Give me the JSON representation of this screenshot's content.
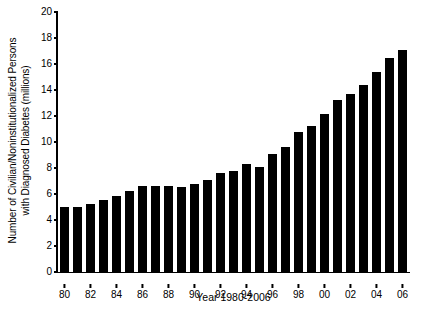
{
  "chart_data": {
    "type": "bar",
    "title": "",
    "xlabel": "Year 1980-2006",
    "ylabel_line1": "Number of Civilian/Noninstitutionalized Persons",
    "ylabel_line2": "with Diagnosed Diabetes (millions)",
    "ylim": [
      0,
      20
    ],
    "yticks": [
      0,
      2,
      4,
      6,
      8,
      10,
      12,
      14,
      16,
      18,
      20
    ],
    "ytick_labels": [
      "0",
      "2",
      "4",
      "6",
      "8",
      "10",
      "12",
      "14",
      "16",
      "18",
      "20"
    ],
    "grid": false,
    "legend": null,
    "bar_color": "#000000",
    "background": "#ffffff",
    "categories": [
      "1980",
      "1981",
      "1982",
      "1983",
      "1984",
      "1985",
      "1986",
      "1987",
      "1988",
      "1989",
      "1990",
      "1991",
      "1992",
      "1993",
      "1994",
      "1995",
      "1996",
      "1997",
      "1998",
      "1999",
      "2000",
      "2001",
      "2002",
      "2003",
      "2004",
      "2005",
      "2006"
    ],
    "xtick_labels": [
      "80",
      "",
      "82",
      "",
      "84",
      "",
      "86",
      "",
      "88",
      "",
      "90",
      "",
      "92",
      "",
      "94",
      "",
      "96",
      "",
      "98",
      "",
      "00",
      "",
      "02",
      "",
      "04",
      "",
      "06"
    ],
    "values": [
      5.0,
      5.0,
      5.25,
      5.55,
      5.85,
      6.2,
      6.6,
      6.6,
      6.6,
      6.55,
      6.8,
      7.1,
      7.6,
      7.75,
      8.3,
      8.1,
      9.05,
      9.6,
      10.75,
      11.2,
      12.15,
      13.2,
      13.7,
      14.35,
      15.4,
      16.45,
      17.05
    ]
  }
}
